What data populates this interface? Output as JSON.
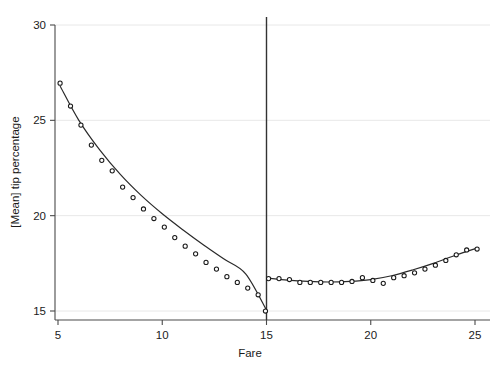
{
  "chart_data": {
    "type": "scatter",
    "title": "",
    "xlabel": "Fare",
    "ylabel": "[Mean] tip percentage",
    "xlim": [
      4.4,
      25.6
    ],
    "ylim": [
      14.2,
      30.4
    ],
    "xticks": [
      5,
      10,
      15,
      20,
      25
    ],
    "xtick_labels": [
      "5",
      "10",
      "15",
      "20",
      "25"
    ],
    "yticks": [
      15,
      20,
      25,
      30
    ],
    "ytick_labels": [
      "15",
      "20",
      "25",
      "30"
    ],
    "grid": true,
    "grid_axis": "y",
    "legend": "none",
    "annotations": [
      {
        "name": "discontinuity-line",
        "type": "vline",
        "x": 15
      }
    ],
    "series": [
      {
        "name": "mean tip percentage below fare 15",
        "marker": "open-circle",
        "x": [
          5.1,
          5.6,
          6.1,
          6.6,
          7.1,
          7.6,
          8.1,
          8.6,
          9.1,
          9.6,
          10.1,
          10.6,
          11.1,
          11.6,
          12.1,
          12.6,
          13.1,
          13.6,
          14.1,
          14.6,
          14.95
        ],
        "y": [
          26.95,
          25.75,
          24.75,
          23.7,
          22.9,
          22.35,
          21.5,
          20.95,
          20.35,
          19.85,
          19.4,
          18.85,
          18.4,
          18.0,
          17.55,
          17.2,
          16.8,
          16.5,
          16.2,
          15.85,
          15.0
        ]
      },
      {
        "name": "mean tip percentage above fare 15",
        "marker": "open-circle",
        "x": [
          15.1,
          15.6,
          16.1,
          16.6,
          17.1,
          17.6,
          18.1,
          18.6,
          19.1,
          19.6,
          20.1,
          20.6,
          21.1,
          21.6,
          22.1,
          22.6,
          23.1,
          23.6,
          24.1,
          24.6,
          25.1
        ],
        "y": [
          16.7,
          16.7,
          16.65,
          16.5,
          16.5,
          16.5,
          16.5,
          16.5,
          16.55,
          16.75,
          16.6,
          16.45,
          16.75,
          16.85,
          17.0,
          17.2,
          17.4,
          17.65,
          17.95,
          18.2,
          18.25
        ]
      }
    ],
    "fits": [
      {
        "name": "smoothed fit below fare 15",
        "x": [
          5.1,
          6.0,
          7.0,
          8.0,
          9.0,
          10.0,
          11.0,
          12.0,
          13.0,
          14.0,
          15.0
        ],
        "y": [
          26.8,
          25.0,
          23.45,
          22.15,
          21.05,
          20.1,
          19.25,
          18.45,
          17.7,
          16.95,
          15.05
        ]
      },
      {
        "name": "smoothed fit above fare 15",
        "x": [
          15.1,
          16.0,
          17.0,
          18.0,
          19.0,
          20.0,
          21.0,
          22.0,
          23.0,
          24.0,
          25.1
        ],
        "y": [
          16.72,
          16.62,
          16.55,
          16.52,
          16.55,
          16.65,
          16.85,
          17.15,
          17.5,
          17.9,
          18.3
        ]
      }
    ]
  },
  "colors": {
    "background": "#ffffff",
    "grid": "#e8e8e8",
    "axis": "#4a4a4a",
    "curve": "#2a2a2a",
    "marker_edge": "#1a1a1a",
    "marker_fill": "#ffffff",
    "reference_line": "#333333"
  }
}
